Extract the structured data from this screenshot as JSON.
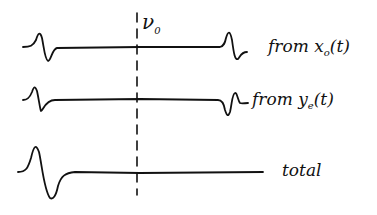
{
  "marker": {
    "label": "ν",
    "sub": "0"
  },
  "traces": [
    {
      "id": "x0",
      "prefix": "from ",
      "var": "x",
      "sub": "o",
      "suffix": "(t)"
    },
    {
      "id": "ye",
      "prefix": "from ",
      "var": "y",
      "sub": "e",
      "suffix": "(t)"
    },
    {
      "id": "total",
      "label": "total"
    }
  ],
  "colors": {
    "ink": "#111111",
    "background": "#ffffff"
  }
}
